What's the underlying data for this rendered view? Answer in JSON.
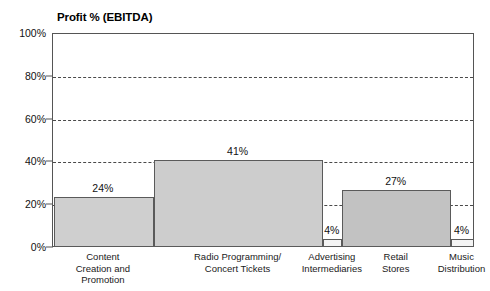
{
  "chart_data": {
    "type": "bar",
    "title": "Profit % (EBITDA)",
    "subtitle": "",
    "xlabel": "",
    "ylabel": "",
    "ylim": [
      0,
      100
    ],
    "grid": true,
    "legend_position": "none",
    "note": "Variable-width (Marimekko-style) bar chart; bars are adjacent and widths differ by segment.",
    "categories": [
      "Content\nCreation and\nPromotion",
      "Radio Programming/\nConcert Tickets",
      "Advertising\nIntermediaries",
      "Retail\nStores",
      "Music\nDistribution"
    ],
    "values": [
      24,
      41,
      4,
      27,
      4
    ],
    "value_labels": [
      "24%",
      "41%",
      "4%",
      "27%",
      "4%"
    ],
    "y_ticks": [
      0,
      20,
      40,
      60,
      80,
      100
    ],
    "y_tick_labels": [
      "0%",
      "20%",
      "40%",
      "60%",
      "80%",
      "100%"
    ],
    "bar_fills": [
      "#cfcfcf",
      "#cdcdcd",
      "#f4f4f4",
      "#c2c2c2",
      "#f4f4f4"
    ],
    "bar_widths_px": [
      100,
      170,
      19,
      109,
      23
    ],
    "colors": {
      "axis": "#555555",
      "gridline": "#4a4a4a",
      "text": "#111111",
      "plot_background": "#ffffff"
    }
  },
  "axis": {
    "y_labels": [
      {
        "text": "100%",
        "value": 100
      },
      {
        "text": "80%",
        "value": 80
      },
      {
        "text": "60%",
        "value": 60
      },
      {
        "text": "40%",
        "value": 40
      },
      {
        "text": "20%",
        "value": 20
      },
      {
        "text": "0%",
        "value": 0
      }
    ]
  },
  "bars": [
    {
      "label": "24%",
      "category": "Content\nCreation and\nPromotion",
      "value": 24
    },
    {
      "label": "41%",
      "category": "Radio Programming/\nConcert Tickets",
      "value": 41
    },
    {
      "label": "4%",
      "category": "Advertising\nIntermediaries",
      "value": 4
    },
    {
      "label": "27%",
      "category": "Retail\nStores",
      "value": 27
    },
    {
      "label": "4%",
      "category": "Music\nDistribution",
      "value": 4
    }
  ]
}
